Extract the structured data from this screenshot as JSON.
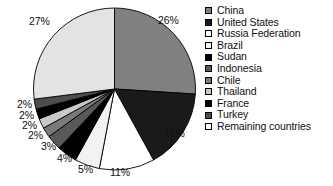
{
  "chart_data": {
    "type": "pie",
    "title": "",
    "subtitle": "",
    "xlabel": "",
    "ylabel": "",
    "legend_position": "right",
    "grid": false,
    "start_angle_deg": 0,
    "direction": "clockwise",
    "categories": [
      "China",
      "United States",
      "Russia Federation",
      "Brazil",
      "Sudan",
      "Indonesia",
      "Chile",
      "Thailand",
      "France",
      "Turkey",
      "Remaining countries"
    ],
    "values": [
      26,
      16,
      11,
      5,
      4,
      3,
      2,
      2,
      2,
      2,
      27
    ],
    "labels": [
      "26%",
      "16%",
      "11%",
      "5%",
      "4%",
      "3%",
      "2%",
      "2%",
      "2%",
      "2%",
      "27%"
    ],
    "colors": [
      "#808080",
      "#1a1a1a",
      "#ffffff",
      "#f2f2f2",
      "#000000",
      "#595959",
      "#7a7a7a",
      "#c9c9c9",
      "#000000",
      "#4d4d4d",
      "#e3e3e3"
    ],
    "slice_edge_color": "#000000",
    "background_color": "#ffffff"
  },
  "legend": {
    "items": [
      {
        "label": "China",
        "swatch": "#808080"
      },
      {
        "label": "United States",
        "swatch": "#1a1a1a"
      },
      {
        "label": "Russia Federation",
        "swatch": "#ffffff"
      },
      {
        "label": "Brazil",
        "swatch": "#f2f2f2"
      },
      {
        "label": "Sudan",
        "swatch": "#000000"
      },
      {
        "label": "Indonesia",
        "swatch": "#595959"
      },
      {
        "label": "Chile",
        "swatch": "#7a7a7a"
      },
      {
        "label": "Thailand",
        "swatch": "#c9c9c9"
      },
      {
        "label": "France",
        "swatch": "#000000"
      },
      {
        "label": "Turkey",
        "swatch": "#4d4d4d"
      },
      {
        "label": "Remaining countries",
        "swatch": "#ffffff"
      }
    ]
  },
  "slice_labels": [
    {
      "text": "26%",
      "x": 158,
      "y": 14
    },
    {
      "text": "16%",
      "x": 164,
      "y": 127
    },
    {
      "text": "11%",
      "x": 110,
      "y": 166
    },
    {
      "text": "5%",
      "x": 78,
      "y": 163
    },
    {
      "text": "4%",
      "x": 57,
      "y": 152
    },
    {
      "text": "3%",
      "x": 41,
      "y": 140
    },
    {
      "text": "2%",
      "x": 28,
      "y": 129
    },
    {
      "text": "2%",
      "x": 22,
      "y": 119
    },
    {
      "text": "2%",
      "x": 19,
      "y": 109
    },
    {
      "text": "2%",
      "x": 17,
      "y": 98
    },
    {
      "text": "27%",
      "x": 29,
      "y": 15
    }
  ]
}
